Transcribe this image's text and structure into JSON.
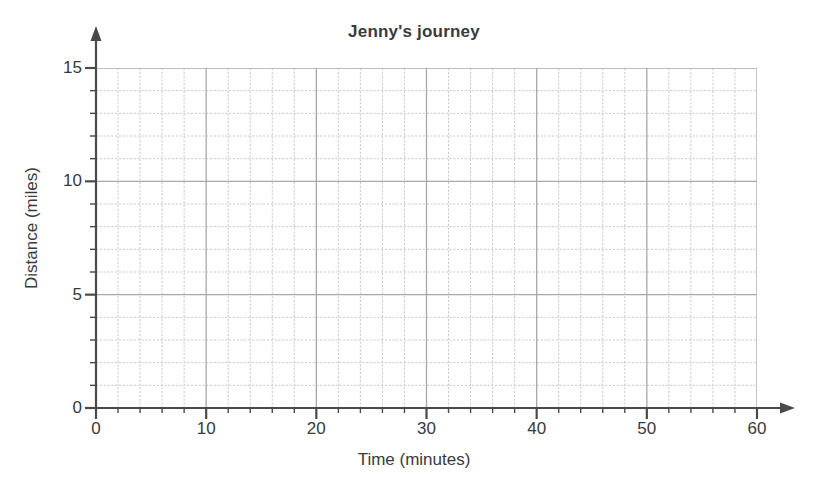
{
  "chart_data": {
    "type": "line",
    "title": "Jenny's journey",
    "xlabel": "Time (minutes)",
    "ylabel": "Distance (miles)",
    "xlim": [
      0,
      60
    ],
    "ylim": [
      0,
      15
    ],
    "x_ticks": [
      "0",
      "10",
      "20",
      "30",
      "40",
      "50",
      "60"
    ],
    "x_tick_values": [
      0,
      10,
      20,
      30,
      40,
      50,
      60
    ],
    "y_ticks": [
      "0",
      "5",
      "10",
      "15"
    ],
    "y_tick_values": [
      0,
      5,
      10,
      15
    ],
    "x_minor_step": 2,
    "y_minor_step": 1,
    "grid": true,
    "legend": "none",
    "series": [],
    "values": [],
    "annotations": [],
    "note": "Empty plotting grid - no data plotted"
  },
  "style": {
    "grid_minor_color": "#c9c9c9",
    "grid_major_color": "#a8a8a8",
    "axis_color": "#4a4a4a",
    "text_color": "#3a3a3a",
    "background": "#ffffff"
  }
}
